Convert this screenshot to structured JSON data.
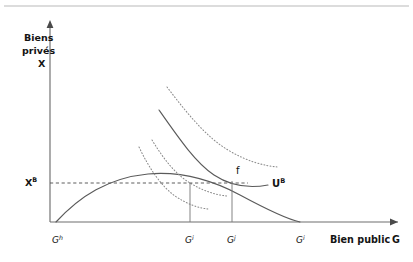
{
  "figure": {
    "kind": "economics-diagram",
    "top_rule": true
  },
  "axes": {
    "y_label_lines": [
      "Biens",
      "privés",
      "X"
    ],
    "x_label": "Bien public",
    "x_label_symbol": "G",
    "y_value_label": "X",
    "y_value_label_sup": "B",
    "origin_px": [
      50,
      222
    ],
    "x_axis_end_px": [
      398,
      222
    ],
    "y_axis_top_px": [
      50,
      22
    ]
  },
  "ticks": [
    {
      "name": "G-h",
      "base": "G",
      "sup": "h",
      "x_px": 56,
      "label_x_px": 52
    },
    {
      "name": "G-i",
      "base": "G",
      "sup": "i",
      "x_px": 190,
      "label_x_px": 185
    },
    {
      "name": "G-j",
      "base": "G",
      "sup": "j",
      "x_px": 232,
      "label_x_px": 227
    },
    {
      "name": "G-i-right",
      "base": "G",
      "sup": "i",
      "x_px": 300,
      "label_x_px": 296
    }
  ],
  "curves": {
    "transformation": {
      "name": "courbe-de-transformation",
      "style": "solid",
      "path": "M 56 222 C 80 196, 108 178, 148 174 C 182 171, 212 180, 240 195 C 266 209, 286 219, 300 222"
    },
    "utility_UB": {
      "name": "courbe-utilite-UB",
      "style": "solid",
      "label": "U",
      "label_sup": "B",
      "label_x_px": 272,
      "label_y_px": 187,
      "path": "M 159 110 C 180 140, 196 163, 214 175 C 232 187, 252 188, 268 185"
    },
    "indifference_dotted": [
      {
        "name": "courbe-indifference-haute",
        "path": "M 167 87 C 186 112, 206 137, 228 150 C 246 161, 264 166, 278 167"
      },
      {
        "name": "courbe-indifference-moyenne",
        "path": "M 152 140 C 163 158, 175 174, 190 183 C 203 191, 216 195, 227 196"
      },
      {
        "name": "courbe-indifference-basse",
        "path": "M 139 147 C 149 168, 161 186, 175 196 C 187 204, 198 208, 208 209"
      }
    ]
  },
  "level_line": {
    "name": "ligne-niveau-XB",
    "y_px": 183,
    "x_start_px": 50,
    "x_end_px": 248
  },
  "drop_lines": [
    {
      "name": "drop-line-Gi",
      "x_px": 190,
      "y_top_px": 183,
      "y_bottom_px": 222
    },
    {
      "name": "drop-line-Gj",
      "x_px": 232,
      "y_top_px": 181,
      "y_bottom_px": 222
    }
  ],
  "points": [
    {
      "name": "point-f",
      "label": "f",
      "x_px": 236,
      "y_px": 174
    }
  ]
}
